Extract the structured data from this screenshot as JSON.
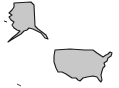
{
  "map": {
    "title": "United States map",
    "regions": [
      {
        "id": "alaska",
        "label": "Alaska"
      },
      {
        "id": "contiguous-us",
        "label": "Contiguous United States"
      },
      {
        "id": "hawaii",
        "label": "Hawaii"
      }
    ],
    "colors": {
      "fill": "#c8c8c8",
      "stroke": "#1a1a1a",
      "background": "#ffffff"
    }
  }
}
